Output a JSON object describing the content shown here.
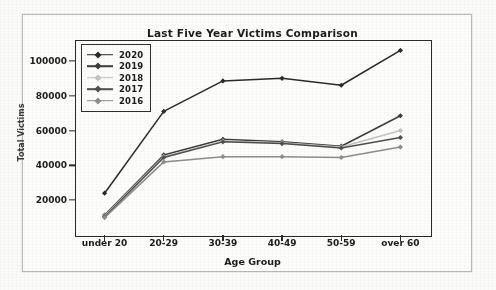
{
  "chart_data": {
    "type": "line",
    "title": "Last Five Year Victims Comparison",
    "xlabel": "Age Group",
    "ylabel": "Total Victims",
    "categories": [
      "under 20",
      "20-29",
      "30-39",
      "40-49",
      "50-59",
      "over 60"
    ],
    "yticks": [
      20000,
      40000,
      60000,
      80000,
      100000
    ],
    "ytick_labels": [
      "20000",
      "40000",
      "60000",
      "80000",
      "100000"
    ],
    "ylim": [
      0,
      112000
    ],
    "grid": false,
    "legend_position": "upper left",
    "marker": "diamond",
    "series": [
      {
        "name": "2020",
        "color": "#2b2b2b",
        "values": [
          24000,
          71000,
          88500,
          90000,
          86000,
          106000
        ]
      },
      {
        "name": "2019",
        "color": "#3d3d3d",
        "values": [
          11500,
          46000,
          55000,
          53500,
          51000,
          68500
        ]
      },
      {
        "name": "2018",
        "color": "#c2c2c2",
        "values": [
          11000,
          45000,
          54000,
          53000,
          50500,
          60000
        ]
      },
      {
        "name": "2017",
        "color": "#4f4f4f",
        "values": [
          10500,
          44500,
          53500,
          52500,
          50000,
          56000
        ]
      },
      {
        "name": "2016",
        "color": "#8d8d8d",
        "values": [
          10000,
          42000,
          45000,
          45000,
          44500,
          50500
        ]
      }
    ]
  }
}
